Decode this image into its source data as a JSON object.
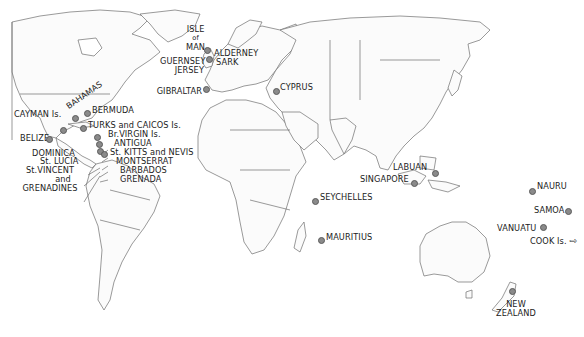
{
  "map": {
    "title": "Offshore financial centres world map",
    "dot_color": "#8a8a8a",
    "land_fill": "#fbfbfb",
    "coastline_color": "#6e6e6e"
  },
  "locations": {
    "isle_of_man": {
      "l1": "ISLE",
      "l2": "of",
      "l3": "MAN"
    },
    "alderney": "ALDERNEY",
    "guernsey": "GUERNSEY",
    "sark": "SARK",
    "jersey": "JERSEY",
    "gibraltar": "GIBRALTAR",
    "cyprus": "CYPRUS",
    "cayman": "CAYMAN Is.",
    "bahamas": "BAHAMAS",
    "bermuda": "BERMUDA",
    "turks_caicos": "TURKS and CAICOS Is.",
    "br_virgin": "Br.VIRGIN Is.",
    "antigua": "ANTIGUA",
    "st_kitts": "St. KITTS and NEVIS",
    "montserrat": "MONTSERRAT",
    "barbados": "BARBADOS",
    "grenada": "GRENADA",
    "belize": "BELIZE",
    "dominica": "DOMINICA",
    "st_lucia": "St. LUCIA",
    "st_vincent": {
      "l1": "St.VINCENT",
      "l2": "and",
      "l3": "GRENADINES"
    },
    "seychelles": "SEYCHELLES",
    "mauritius": "MAURITIUS",
    "labuan": "LABUAN",
    "singapore": "SINGAPORE",
    "nauru": "NAURU",
    "samoa": "SAMOA",
    "vanuatu": "VANUATU",
    "cook": "COOK Is.",
    "cook_arrow": "⇨",
    "new_zealand": {
      "l1": "NEW",
      "l2": "ZEALAND"
    }
  }
}
